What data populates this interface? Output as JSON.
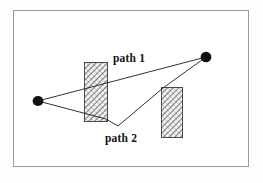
{
  "figure": {
    "name": "two-paths-around-obstacles-diagram",
    "background_color": "#fdfdfd",
    "frame": {
      "label": "diagram-frame",
      "x": 13,
      "y": 10,
      "width": 235,
      "height": 156,
      "stroke_color": "#9a9a9a",
      "fill_color": "#ffffff",
      "stroke_width": 1
    },
    "nodes": [
      {
        "id": "start-node",
        "label": "",
        "cx": 38,
        "cy": 101,
        "rx": 5.4,
        "ry": 5.0,
        "fill_color": "#111111"
      },
      {
        "id": "goal-node",
        "label": "",
        "cx": 206,
        "cy": 57,
        "rx": 5.4,
        "ry": 5.2,
        "fill_color": "#111111"
      }
    ],
    "obstacles": [
      {
        "id": "obstacle-left",
        "x": 84,
        "y": 62,
        "width": 23,
        "height": 59,
        "stroke_color": "#4a4a4a",
        "hatch_color": "#5a5a5a",
        "fill_color": "#f2f2f2"
      },
      {
        "id": "obstacle-right",
        "x": 161,
        "y": 87,
        "width": 21,
        "height": 50,
        "stroke_color": "#4a4a4a",
        "hatch_color": "#5a5a5a",
        "fill_color": "#f2f2f2"
      }
    ],
    "paths": [
      {
        "id": "path-1",
        "label": "path 1",
        "stroke_color": "#1c1c1c",
        "stroke_width": 0.9,
        "points": "38,101 206,57",
        "label_x": 113,
        "label_y": 62
      },
      {
        "id": "path-2",
        "label": "path 2",
        "stroke_color": "#1c1c1c",
        "stroke_width": 0.9,
        "points": "38,101 106,119 118,126 163,88 206,57",
        "label_x": 105,
        "label_y": 142
      }
    ]
  }
}
